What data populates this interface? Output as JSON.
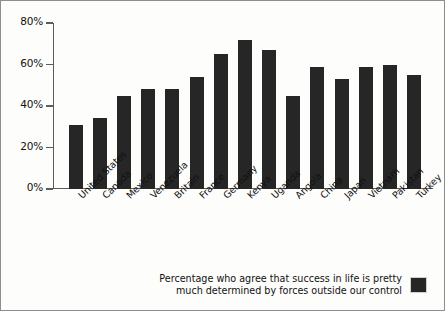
{
  "chart_data": {
    "type": "bar",
    "title": "",
    "subtitle": "",
    "xlabel": "",
    "ylabel": "",
    "ylim": [
      0,
      80
    ],
    "grid": false,
    "legend_position": "bottom-right",
    "y_ticks": [
      "0%",
      "20%",
      "40%",
      "60%",
      "80%"
    ],
    "y_tick_values": [
      0,
      20,
      40,
      60,
      80
    ],
    "categories": [
      "United States",
      "Canada",
      "Mexico",
      "Venezuela",
      "Britain",
      "France",
      "Germany",
      "Kenya",
      "Uganda",
      "Angola",
      "China",
      "Japan",
      "Vietnam",
      "Pakistan",
      "Turkey"
    ],
    "values": [
      31,
      34,
      45,
      48,
      48,
      54,
      65,
      72,
      67,
      45,
      59,
      53,
      59,
      60,
      55
    ],
    "series": [
      {
        "name": "Percentage who agree that success in life is pretty much determined by forces outside our control",
        "values": [
          31,
          34,
          45,
          48,
          48,
          54,
          65,
          72,
          67,
          45,
          59,
          53,
          59,
          60,
          55
        ]
      }
    ],
    "legend": [
      {
        "label": "Percentage who agree that success in life is pretty\nmuch determined by forces outside our control",
        "color": "#262626"
      }
    ],
    "colors": {
      "bar": "#262626",
      "axis": "#5c5c5c",
      "text": "#111111",
      "background": "#fdfdfb",
      "border": "#8d8d8d"
    }
  }
}
